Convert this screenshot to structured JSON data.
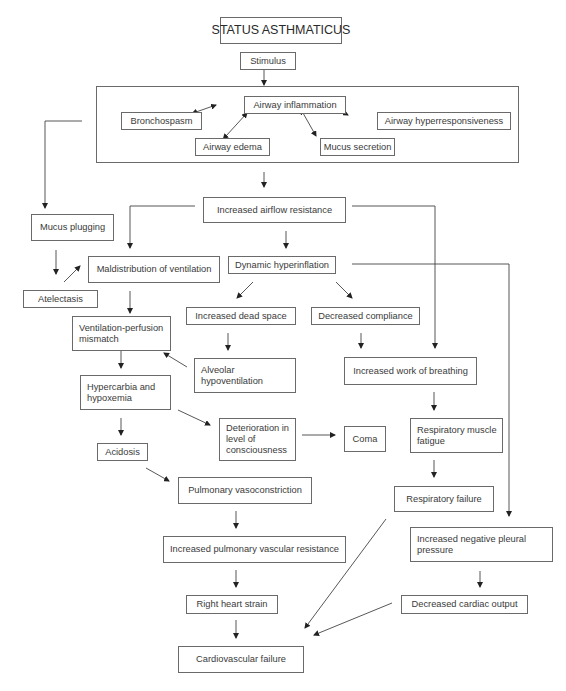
{
  "diagram": {
    "title": "STATUS ASTHMATICUS",
    "nodes": {
      "stimulus": "Stimulus",
      "airway_inflammation": "Airway inflammation",
      "bronchospasm": "Bronchospasm",
      "airway_hyperresponsiveness": "Airway hyperresponsiveness",
      "airway_edema": "Airway edema",
      "mucus_secretion": "Mucus secretion",
      "increased_airflow_resistance": "Increased airflow resistance",
      "mucus_plugging": "Mucus plugging",
      "maldistribution_of_ventilation": "Maldistribution of ventilation",
      "dynamic_hyperinflation": "Dynamic hyperinflation",
      "atelectasis": "Atelectasis",
      "increased_dead_space": "Increased dead space",
      "decreased_compliance": "Decreased compliance",
      "vq_mismatch": "Ventilation-perfusion mismatch",
      "alveolar_hypoventilation": "Alveolar hypoventilation",
      "increased_work_of_breathing": "Increased work of breathing",
      "hypercarbia_hypoxemia": "Hypercarbia and hypoxemia",
      "deterioration_consciousness": "Deterioration in level of consciousness",
      "coma": "Coma",
      "respiratory_muscle_fatigue": "Respiratory muscle fatigue",
      "acidosis": "Acidosis",
      "pulmonary_vasoconstriction": "Pulmonary vasoconstriction",
      "respiratory_failure": "Respiratory failure",
      "increased_pulmonary_vascular_resistance": "Increased pulmonary vascular resistance",
      "increased_negative_pleural_pressure": "Increased negative pleural pressure",
      "right_heart_strain": "Right heart strain",
      "decreased_cardiac_output": "Decreased cardiac output",
      "cardiovascular_failure": "Cardiovascular failure"
    },
    "edges": [
      [
        "stimulus",
        "inflammation_group"
      ],
      [
        "airway_inflammation",
        "bronchospasm",
        "bidirectional"
      ],
      [
        "airway_inflammation",
        "airway_edema",
        "bidirectional"
      ],
      [
        "airway_inflammation",
        "mucus_secretion",
        "bidirectional"
      ],
      [
        "airway_inflammation",
        "airway_hyperresponsiveness",
        "bidirectional"
      ],
      [
        "inflammation_group",
        "increased_airflow_resistance"
      ],
      [
        "inflammation_group",
        "mucus_plugging"
      ],
      [
        "increased_airflow_resistance",
        "maldistribution_of_ventilation"
      ],
      [
        "increased_airflow_resistance",
        "dynamic_hyperinflation"
      ],
      [
        "increased_airflow_resistance",
        "increased_work_of_breathing"
      ],
      [
        "mucus_plugging",
        "atelectasis"
      ],
      [
        "atelectasis",
        "maldistribution_of_ventilation"
      ],
      [
        "maldistribution_of_ventilation",
        "vq_mismatch"
      ],
      [
        "dynamic_hyperinflation",
        "increased_dead_space"
      ],
      [
        "dynamic_hyperinflation",
        "decreased_compliance"
      ],
      [
        "dynamic_hyperinflation",
        "increased_negative_pleural_pressure"
      ],
      [
        "increased_dead_space",
        "alveolar_hypoventilation"
      ],
      [
        "alveolar_hypoventilation",
        "vq_mismatch"
      ],
      [
        "decreased_compliance",
        "increased_work_of_breathing"
      ],
      [
        "vq_mismatch",
        "hypercarbia_hypoxemia"
      ],
      [
        "hypercarbia_hypoxemia",
        "deterioration_consciousness"
      ],
      [
        "hypercarbia_hypoxemia",
        "acidosis"
      ],
      [
        "deterioration_consciousness",
        "coma"
      ],
      [
        "increased_work_of_breathing",
        "respiratory_muscle_fatigue"
      ],
      [
        "respiratory_muscle_fatigue",
        "respiratory_failure"
      ],
      [
        "acidosis",
        "pulmonary_vasoconstriction"
      ],
      [
        "pulmonary_vasoconstriction",
        "increased_pulmonary_vascular_resistance"
      ],
      [
        "increased_pulmonary_vascular_resistance",
        "right_heart_strain"
      ],
      [
        "right_heart_strain",
        "cardiovascular_failure"
      ],
      [
        "respiratory_failure",
        "cardiovascular_failure"
      ],
      [
        "increased_negative_pleural_pressure",
        "decreased_cardiac_output"
      ],
      [
        "decreased_cardiac_output",
        "cardiovascular_failure"
      ]
    ]
  }
}
